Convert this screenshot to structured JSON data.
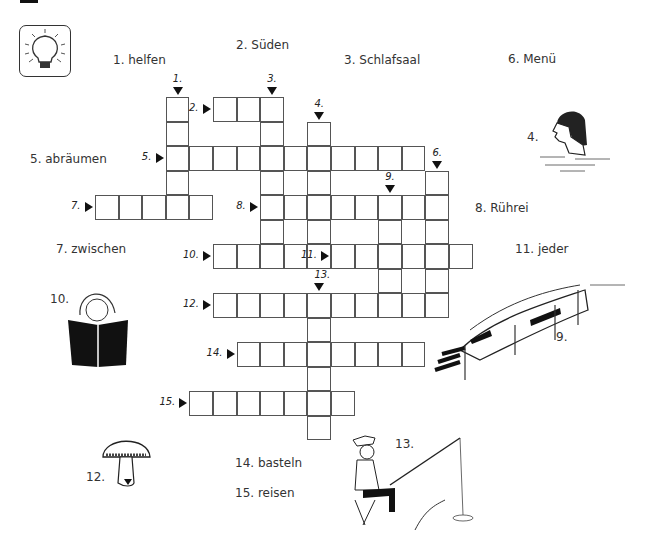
{
  "grid": {
    "x0": 95,
    "y0": 97,
    "cell_w": 23.6,
    "cell_h": 24.5
  },
  "icon": "lightbulb-icon",
  "clues": [
    {
      "id": 1,
      "text": "1. helfen",
      "x": 113,
      "y": 53
    },
    {
      "id": 2,
      "text": "2. Süden",
      "x": 236,
      "y": 38
    },
    {
      "id": 3,
      "text": "3. Schlafsaal",
      "x": 344,
      "y": 53
    },
    {
      "id": 6,
      "text": "6. Menü",
      "x": 508,
      "y": 52
    },
    {
      "id": 5,
      "text": "5. abräumen",
      "x": 30,
      "y": 152
    },
    {
      "id": 8,
      "text": "8. Rührei",
      "x": 475,
      "y": 201
    },
    {
      "id": 7,
      "text": "7. zwischen",
      "x": 56,
      "y": 242
    },
    {
      "id": 11,
      "text": "11. jeder",
      "x": 515,
      "y": 242
    },
    {
      "id": 14,
      "text": "14. basteln",
      "x": 235,
      "y": 456
    },
    {
      "id": 15,
      "text": "15. reisen",
      "x": 235,
      "y": 486
    }
  ],
  "words": [
    {
      "num": "1.",
      "dir": "down",
      "col": 3,
      "row": 0,
      "len": 5
    },
    {
      "num": "2.",
      "dir": "across",
      "col": 5,
      "row": 0,
      "len": 3
    },
    {
      "num": "3.",
      "dir": "down",
      "col": 7,
      "row": 0,
      "len": 7
    },
    {
      "num": "4.",
      "dir": "down",
      "col": 9,
      "row": 1,
      "len": 6
    },
    {
      "num": "5.",
      "dir": "across",
      "col": 3,
      "row": 2,
      "len": 11
    },
    {
      "num": "6.",
      "dir": "down",
      "col": 14,
      "row": 3,
      "len": 6
    },
    {
      "num": "7.",
      "dir": "across",
      "col": 0,
      "row": 4,
      "len": 5
    },
    {
      "num": "8.",
      "dir": "across",
      "col": 7,
      "row": 4,
      "len": 8
    },
    {
      "num": "9.",
      "dir": "down",
      "col": 12,
      "row": 4,
      "len": 5
    },
    {
      "num": "10.",
      "dir": "across",
      "col": 5,
      "row": 6,
      "len": 4
    },
    {
      "num": "11.",
      "dir": "across",
      "col": 10,
      "row": 6,
      "len": 6
    },
    {
      "num": "12.",
      "dir": "across",
      "col": 5,
      "row": 8,
      "len": 10
    },
    {
      "num": "13.",
      "dir": "down",
      "col": 9,
      "row": 8,
      "len": 6
    },
    {
      "num": "14.",
      "dir": "across",
      "col": 6,
      "row": 10,
      "len": 8
    },
    {
      "num": "15.",
      "dir": "across",
      "col": 4,
      "row": 12,
      "len": 7
    }
  ],
  "pictures": [
    {
      "name": "swimmer",
      "label": "4.",
      "label_x": 527,
      "label_y": 130
    },
    {
      "name": "reading-girl",
      "label": "10.",
      "label_x": 50,
      "label_y": 292
    },
    {
      "name": "train",
      "label": "9.",
      "label_x": 556,
      "label_y": 330
    },
    {
      "name": "mushroom",
      "label": "12.",
      "label_x": 86,
      "label_y": 470
    },
    {
      "name": "fisherman",
      "label": "13.",
      "label_x": 395,
      "label_y": 437
    }
  ]
}
